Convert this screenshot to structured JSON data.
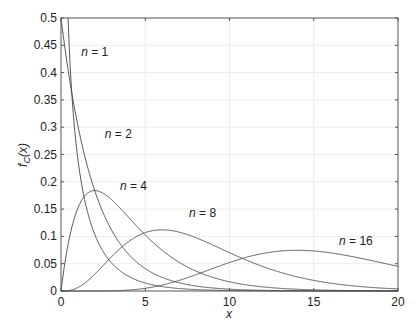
{
  "chart_data": {
    "type": "line",
    "title": "",
    "xlabel": "x",
    "ylabel": "f_C(x)",
    "xlim": [
      0,
      20
    ],
    "ylim": [
      0,
      0.5
    ],
    "grid": true,
    "legend": "none (inline labels)",
    "x_ticks": [
      "0",
      "5",
      "10",
      "15",
      "20"
    ],
    "y_ticks": [
      "0",
      "0.05",
      "0.1",
      "0.15",
      "0.2",
      "0.25",
      "0.3",
      "0.35",
      "0.4",
      "0.45",
      "0.5"
    ],
    "series": [
      {
        "name": "n = 1",
        "dof": 1,
        "x": [
          0.5,
          1,
          2,
          3,
          5,
          10
        ],
        "values": [
          0.439,
          0.242,
          0.104,
          0.051,
          0.015,
          0.001
        ]
      },
      {
        "name": "n = 2",
        "dof": 2,
        "x": [
          0,
          1,
          2,
          4,
          6,
          10,
          20
        ],
        "values": [
          0.5,
          0.303,
          0.184,
          0.068,
          0.025,
          0.003,
          0.0
        ]
      },
      {
        "name": "n = 4",
        "dof": 4,
        "x": [
          0,
          1,
          2,
          4,
          6,
          10,
          20
        ],
        "values": [
          0,
          0.152,
          0.184,
          0.135,
          0.075,
          0.017,
          0.0
        ]
      },
      {
        "name": "n = 8",
        "dof": 8,
        "x": [
          0,
          2,
          4,
          6,
          8,
          10,
          15,
          20
        ],
        "values": [
          0,
          0.031,
          0.09,
          0.112,
          0.098,
          0.067,
          0.017,
          0.003
        ]
      },
      {
        "name": "n = 16",
        "dof": 16,
        "x": [
          0,
          5,
          10,
          14,
          16,
          20
        ],
        "values": [
          0,
          0.007,
          0.053,
          0.075,
          0.07,
          0.045
        ]
      }
    ],
    "annotations": [
      {
        "text": "n = 1",
        "x": 1.2,
        "y": 0.43
      },
      {
        "text": "n = 2",
        "x": 2.6,
        "y": 0.28
      },
      {
        "text": "n = 4",
        "x": 3.5,
        "y": 0.185
      },
      {
        "text": "n = 8",
        "x": 7.6,
        "y": 0.135
      },
      {
        "text": "n = 16",
        "x": 16.5,
        "y": 0.085
      }
    ]
  },
  "labels": {
    "xlabel": "x",
    "ylabel_f": "f",
    "ylabel_sub": "C",
    "ylabel_arg": "(x)"
  }
}
